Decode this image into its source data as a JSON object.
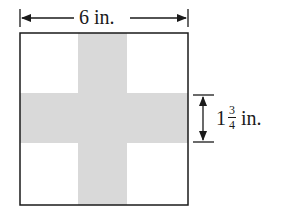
{
  "diagram": {
    "top_label": "6 in.",
    "side_label": {
      "whole": "1",
      "numerator": "3",
      "denominator": "4",
      "unit": "in."
    },
    "colors": {
      "band": "#d9d9d9",
      "stroke": "#1a1a1a",
      "background": "#ffffff"
    }
  }
}
